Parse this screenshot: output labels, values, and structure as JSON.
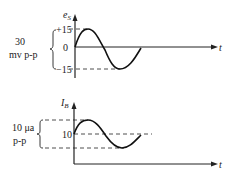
{
  "top_graph": {
    "y_label": "e",
    "y_label_sub": "S",
    "x_label": "t",
    "ticks": {
      "plus": "+15",
      "zero": "0",
      "minus": "−15"
    },
    "amplitude_label_line1": "30",
    "amplitude_label_line2": "mv p-p"
  },
  "bottom_graph": {
    "y_label": "I",
    "y_label_sub": "B",
    "x_label": "t",
    "ticks": {
      "mid": "10"
    },
    "amplitude_label_line1": "10 μa",
    "amplitude_label_line2": "p-p"
  },
  "colors": {
    "ink": "#222222",
    "background": "#ffffff"
  }
}
